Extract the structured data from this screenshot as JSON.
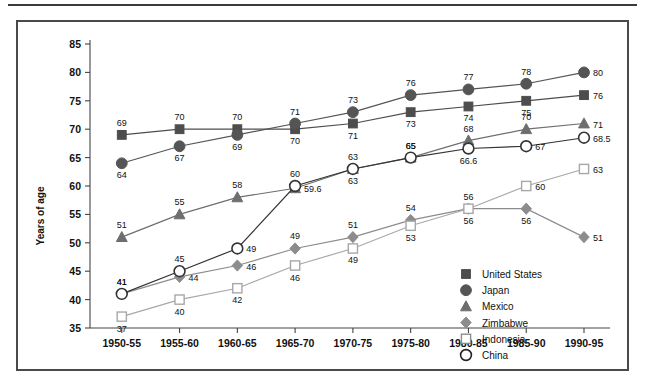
{
  "chart_data": {
    "type": "line",
    "title": "",
    "xlabel": "",
    "ylabel": "Years of age",
    "ylim": [
      35,
      85
    ],
    "ytick_step": 5,
    "yticks": [
      "35",
      "40",
      "45",
      "50",
      "55",
      "60",
      "65",
      "70",
      "75",
      "80",
      "85"
    ],
    "grid": false,
    "legend_position": "inside-lower-right",
    "categories": [
      "1950-55",
      "1955-60",
      "1960-65",
      "1965-70",
      "1970-75",
      "1975-80",
      "1980-85",
      "1985-90",
      "1990-95"
    ],
    "series": [
      {
        "name": "United States",
        "marker": "filled-square",
        "color": "#4d4d4d",
        "values": [
          69,
          70,
          70,
          70,
          71,
          73,
          74,
          75,
          76
        ],
        "labels": [
          "69",
          "70",
          "70",
          "70",
          "71",
          "73",
          "74",
          "75",
          "76"
        ],
        "label_pos": [
          "above",
          "above",
          "above",
          "below",
          "below",
          "below",
          "below",
          "below",
          "right"
        ]
      },
      {
        "name": "Japan",
        "marker": "filled-circle",
        "color": "#555555",
        "values": [
          64,
          67,
          69,
          71,
          73,
          76,
          77,
          78,
          80
        ],
        "labels": [
          "64",
          "67",
          "69",
          "71",
          "73",
          "76",
          "77",
          "78",
          "80"
        ],
        "label_pos": [
          "below",
          "below",
          "below",
          "above",
          "above",
          "above",
          "above",
          "above",
          "right"
        ]
      },
      {
        "name": "Mexico",
        "marker": "filled-triangle",
        "color": "#6e6e6e",
        "values": [
          51,
          55,
          58,
          59.6,
          63,
          65,
          68,
          70,
          71
        ],
        "labels": [
          "51",
          "55",
          "58",
          "59.6",
          "63",
          "65",
          "68",
          "70",
          "71"
        ],
        "label_pos": [
          "above",
          "above",
          "above",
          "right",
          "below",
          "above",
          "above",
          "above",
          "right"
        ]
      },
      {
        "name": "Zimbabwe",
        "marker": "filled-diamond",
        "color": "#8c8c8c",
        "values": [
          41,
          44,
          46,
          49,
          51,
          54,
          56,
          56,
          51
        ],
        "labels": [
          "41",
          "44",
          "46",
          "49",
          "51",
          "54",
          "56",
          "56",
          "51"
        ],
        "label_pos": [
          "above",
          "right",
          "right",
          "above",
          "above",
          "above",
          "below",
          "below",
          "right"
        ]
      },
      {
        "name": "Indonesia",
        "marker": "open-square",
        "color": "#a8a8a8",
        "values": [
          37,
          40,
          42,
          46,
          49,
          53,
          56,
          60,
          63
        ],
        "labels": [
          "37",
          "40",
          "42",
          "46",
          "49",
          "53",
          "56",
          "60",
          "63"
        ],
        "label_pos": [
          "below",
          "below",
          "below",
          "below",
          "below",
          "below",
          "above",
          "right",
          "right"
        ]
      },
      {
        "name": "China",
        "marker": "open-circle",
        "color": "#333333",
        "values": [
          41,
          45,
          49,
          60,
          63,
          65,
          66.6,
          67,
          68.5
        ],
        "labels": [
          "41",
          "45",
          "49",
          "60",
          "63",
          "65",
          "66.6",
          "67",
          "68.5"
        ],
        "label_pos": [
          "above",
          "above",
          "right",
          "above",
          "above",
          "above",
          "below",
          "right",
          "right"
        ]
      }
    ]
  },
  "axis": {
    "y_title": "Years of age"
  },
  "legend": {
    "items": [
      {
        "label": "United States",
        "marker": "filled-square",
        "color": "#4d4d4d"
      },
      {
        "label": "Japan",
        "marker": "filled-circle",
        "color": "#555555"
      },
      {
        "label": "Mexico",
        "marker": "filled-triangle",
        "color": "#6e6e6e"
      },
      {
        "label": "Zimbabwe",
        "marker": "filled-diamond",
        "color": "#8c8c8c"
      },
      {
        "label": "Indonesia",
        "marker": "open-square",
        "color": "#8c8c8c"
      },
      {
        "label": "China",
        "marker": "open-circle",
        "color": "#222222"
      }
    ]
  }
}
